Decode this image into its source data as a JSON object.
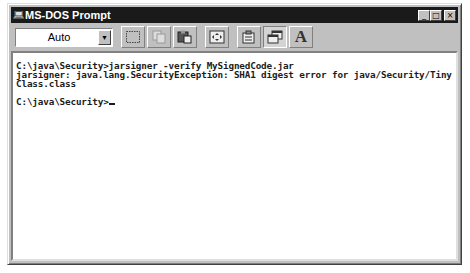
{
  "window": {
    "title": "MS-DOS Prompt",
    "icon": "ms-dos-icon",
    "controls": {
      "minimize": "_",
      "maximize": "□",
      "close": "×"
    }
  },
  "toolbar": {
    "font_size_select": {
      "value": "Auto"
    },
    "buttons": [
      {
        "name": "mark-button",
        "icon": "mark-icon"
      },
      {
        "name": "copy-button",
        "icon": "copy-icon",
        "disabled": true
      },
      {
        "name": "paste-button",
        "icon": "paste-icon"
      },
      {
        "name": "full-screen-button",
        "icon": "full-screen-icon"
      },
      {
        "name": "properties-button",
        "icon": "properties-icon"
      },
      {
        "name": "background-button",
        "icon": "background-icon",
        "pressed": true
      },
      {
        "name": "font-button",
        "icon": "font-icon",
        "label": "A"
      }
    ]
  },
  "console": {
    "lines": [
      "C:\\java\\Security>jarsigner -verify MySignedCode.jar",
      "jarsigner: java.lang.SecurityException: SHA1 digest error for java/Security/Tiny",
      "Class.class",
      "",
      "C:\\java\\Security>"
    ]
  }
}
